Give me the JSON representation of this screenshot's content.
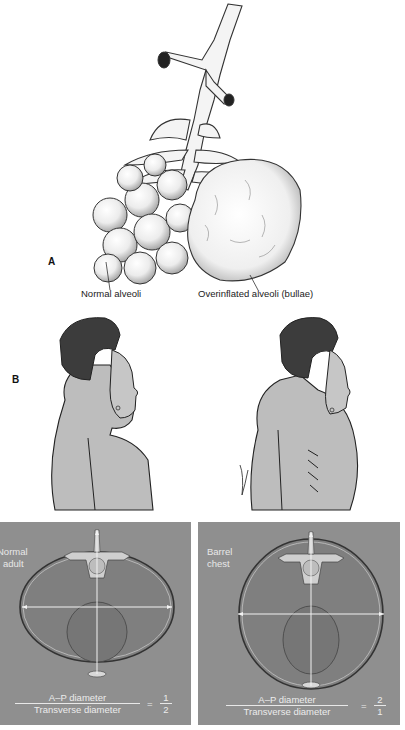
{
  "figure": {
    "panel_a": {
      "letter": "A",
      "labels": {
        "normal": "Normal alveoli",
        "overinflated": "Overinflated alveoli (bullae)"
      }
    },
    "panel_b": {
      "letter": "B",
      "figures": [
        "normal-profile",
        "barrel-chest-profile"
      ]
    },
    "panel_c": {
      "left": {
        "title_line1": "Normal",
        "title_line2": "adult",
        "numerator_label": "A–P diameter",
        "denominator_label": "Transverse diameter",
        "equals": "=",
        "ratio_num": "1",
        "ratio_den": "2"
      },
      "right": {
        "title_line1": "Barrel",
        "title_line2": "chest",
        "numerator_label": "A–P diameter",
        "denominator_label": "Transverse diameter",
        "equals": "=",
        "ratio_num": "2",
        "ratio_den": "1"
      }
    },
    "colors": {
      "panel_gray": "#8f8f8f",
      "panel_text": "#e8e8e8",
      "skin": "#b9b9b9",
      "hair": "#3a3a3a"
    }
  }
}
